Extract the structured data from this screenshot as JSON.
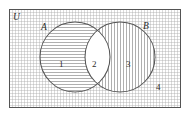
{
  "figure": {
    "type": "venn-diagram",
    "sets_count": 2,
    "regions_count": 4
  },
  "labels": {
    "universe": "U",
    "set_a": "A",
    "set_b": "B",
    "region_1": "1",
    "region_2": "2",
    "region_3": "3",
    "region_4": "4"
  },
  "regions": [
    {
      "id": "1",
      "name": "A only",
      "label": "1",
      "fill": "horizontal-hatch"
    },
    {
      "id": "2",
      "name": "A and B intersection",
      "label": "2",
      "fill": "none"
    },
    {
      "id": "3",
      "name": "B only",
      "label": "3",
      "fill": "vertical-hatch"
    },
    {
      "id": "4",
      "name": "outside A and B",
      "label": "4",
      "fill": "grid-hatch"
    }
  ],
  "colors": {
    "stroke": "#545454",
    "hatch": "#9b9b9b",
    "grid": "#a8a8a8",
    "background": "#ffffff",
    "text": "#2b2b2b"
  },
  "geometry": {
    "rect": {
      "x": 9,
      "y": 9,
      "width": 172,
      "height": 99
    },
    "circle_a": {
      "cx": 75,
      "cy": 57,
      "r": 35
    },
    "circle_b": {
      "cx": 120,
      "cy": 57,
      "r": 35
    }
  }
}
